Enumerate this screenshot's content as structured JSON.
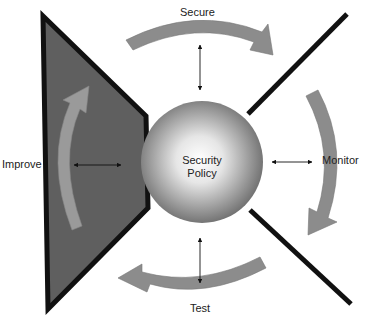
{
  "diagram": {
    "center": {
      "line1": "Security",
      "line2": "Policy"
    },
    "stages": [
      {
        "id": "secure",
        "label": "Secure"
      },
      {
        "id": "monitor",
        "label": "Monitor"
      },
      {
        "id": "test",
        "label": "Test"
      },
      {
        "id": "improve",
        "label": "Improve"
      }
    ],
    "colors": {
      "triangle_fill": "#5f5f5f",
      "triangle_stroke": "#111111",
      "arrow_fill": "#8c8c8c",
      "sphere_light": "#ffffff",
      "sphere_dark": "#6a6a6a",
      "line": "#111111"
    }
  }
}
